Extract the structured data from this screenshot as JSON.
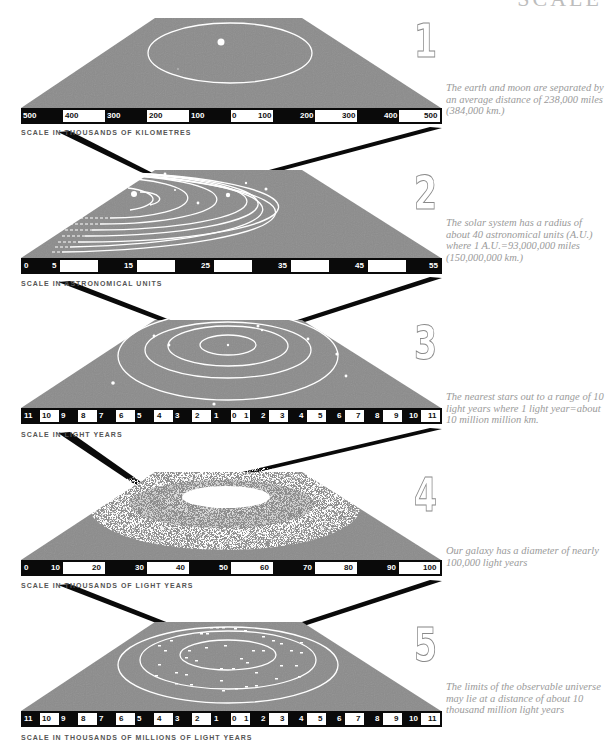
{
  "title": "SCALE",
  "panels": [
    {
      "number": "1",
      "caption": "SCALE IN THOUSANDS OF KILOMETRES",
      "description": "The earth and moon are separated by an average distance of 238,000 miles (384,000 km.)",
      "scale_labels": [
        "500",
        "400",
        "300",
        "200",
        "100",
        "0",
        "100",
        "200",
        "300",
        "400",
        "500"
      ],
      "scene": "earth-moon orbit"
    },
    {
      "number": "2",
      "caption": "SCALE IN ASTRONOMICAL UNITS",
      "description": "The solar system has a radius of about 40 astronomical units (A.U.) where 1 A.U.=93,000,000 miles (150,000,000 km.)",
      "scale_labels": [
        "0",
        "5",
        "15",
        "25",
        "35",
        "45",
        "55"
      ],
      "scene": "solar system orbits"
    },
    {
      "number": "3",
      "caption": "SCALE IN LIGHT YEARS",
      "description": "The nearest stars out to a range of 10 light years where 1 light year=about 10 million million km.",
      "scale_labels": [
        "11",
        "10",
        "9",
        "8",
        "7",
        "6",
        "5",
        "4",
        "3",
        "2",
        "1",
        "0",
        "1",
        "2",
        "3",
        "4",
        "5",
        "6",
        "7",
        "8",
        "9",
        "10",
        "11"
      ],
      "scene": "nearest stars"
    },
    {
      "number": "4",
      "caption": "SCALE IN THOUSANDS OF LIGHT YEARS",
      "description": "Our galaxy has a diameter of nearly 100,000 light years",
      "scale_labels": [
        "0",
        "10",
        "20",
        "30",
        "40",
        "50",
        "60",
        "70",
        "80",
        "90",
        "100"
      ],
      "scene": "galaxy"
    },
    {
      "number": "5",
      "caption": "SCALE IN THOUSANDS OF MILLIONS OF LIGHT YEARS",
      "description": "The limits of the observable universe may lie at a distance of about 10 thousand million light years",
      "scale_labels": [
        "11",
        "10",
        "9",
        "8",
        "7",
        "6",
        "5",
        "4",
        "3",
        "2",
        "1",
        "0",
        "1",
        "2",
        "3",
        "4",
        "5",
        "6",
        "7",
        "8",
        "9",
        "10",
        "11"
      ],
      "scene": "observable universe"
    }
  ],
  "colors": {
    "plate": "#8c8c8c",
    "scale_black": "#0a0a0a",
    "scale_white": "#ffffff",
    "orbit": "#ffffff",
    "text_gray": "#9a9a9a"
  }
}
